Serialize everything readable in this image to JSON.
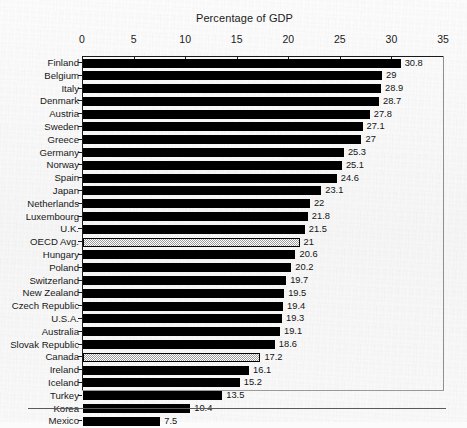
{
  "chart_data": {
    "type": "bar",
    "orientation": "horizontal",
    "title": "Percentage of GDP",
    "xlabel": "",
    "ylabel": "",
    "xlim": [
      0,
      35
    ],
    "xticks": [
      0,
      5,
      10,
      15,
      20,
      25,
      30,
      35
    ],
    "grid": false,
    "legend": null,
    "highlight_color": "#d8d8d8",
    "bar_color": "#000000",
    "categories": [
      "Finland",
      "Belgium",
      "Italy",
      "Denmark",
      "Austria",
      "Sweden",
      "Greece",
      "Germany",
      "Norway",
      "Spain",
      "Japan",
      "Netherlands",
      "Luxembourg",
      "U.K.",
      "OECD Avg.",
      "Hungary",
      "Poland",
      "Switzerland",
      "New Zealand",
      "Czech Republic",
      "U.S.A.",
      "Australia",
      "Slovak Republic",
      "Canada",
      "Ireland",
      "Iceland",
      "Turkey",
      "Korea",
      "Mexico"
    ],
    "values": [
      30.8,
      29,
      28.9,
      28.7,
      27.8,
      27.1,
      27,
      25.3,
      25.1,
      24.6,
      23.1,
      22,
      21.8,
      21.5,
      21,
      20.6,
      20.2,
      19.7,
      19.5,
      19.4,
      19.3,
      19.1,
      18.6,
      17.2,
      16.1,
      15.2,
      13.5,
      10.4,
      7.5
    ],
    "value_labels": [
      "30.8",
      "29",
      "28.9",
      "28.7",
      "27.8",
      "27.1",
      "27",
      "25.3",
      "25.1",
      "24.6",
      "23.1",
      "22",
      "21.8",
      "21.5",
      "21",
      "20.6",
      "20.2",
      "19.7",
      "19.5",
      "19.4",
      "19.3",
      "19.1",
      "18.6",
      "17.2",
      "16.1",
      "15.2",
      "13.5",
      "10.4",
      "7.5"
    ],
    "highlighted": [
      "OECD Avg.",
      "Canada"
    ]
  }
}
